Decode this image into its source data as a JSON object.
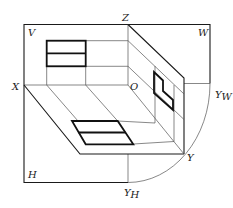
{
  "diagram": {
    "colors": {
      "line": "#1a1a1a",
      "thin": "#555555",
      "background": "#ffffff"
    },
    "labels": {
      "Z": "Z",
      "V": "V",
      "W": "W",
      "X": "X",
      "O": "O",
      "Y": "Y",
      "YW": "Y",
      "YW_sub": "W",
      "H": "H",
      "YH": "Y",
      "YH_sub": "H"
    }
  }
}
